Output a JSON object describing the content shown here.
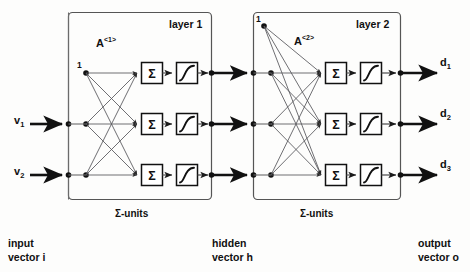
{
  "figure": {
    "type": "neural-network-architecture-diagram",
    "colors": {
      "ink": "#101010",
      "line": "#4a4a4a",
      "box_stroke": "#4a4a4a",
      "unit_stroke": "#101010",
      "background": "#fdfdfc"
    }
  },
  "layers": [
    {
      "id": "layer-1",
      "title": "layer 1",
      "matrix_label": "A",
      "matrix_superscript": "<1>",
      "bias_label": "1",
      "units_caption": "Σ-units",
      "unit_symbol": "Σ",
      "unit_count": 3,
      "activation": "sigmoid"
    },
    {
      "id": "layer-2",
      "title": "layer 2",
      "matrix_label": "A",
      "matrix_superscript": "<2>",
      "bias_label": "1",
      "units_caption": "Σ-units",
      "unit_symbol": "Σ",
      "unit_count": 3,
      "activation": "sigmoid"
    }
  ],
  "inputs": [
    {
      "label": "v",
      "subscript": "1"
    },
    {
      "label": "v",
      "subscript": "2"
    }
  ],
  "outputs": [
    {
      "label": "d",
      "subscript": "1"
    },
    {
      "label": "d",
      "subscript": "2"
    },
    {
      "label": "d",
      "subscript": "3"
    }
  ],
  "captions": [
    {
      "id": "input",
      "line1": "input",
      "line2": "vector i"
    },
    {
      "id": "hidden",
      "line1": "hidden",
      "line2": "vector h"
    },
    {
      "id": "output",
      "line1": "output",
      "line2": "vector o"
    }
  ]
}
